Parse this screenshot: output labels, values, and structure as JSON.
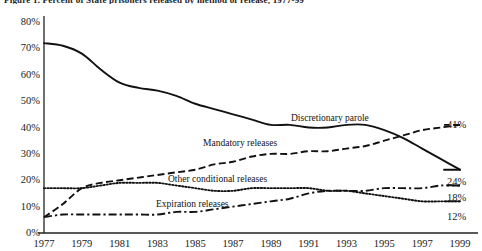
{
  "title": "Figure 1. Percent of State prisoners released by method of release, 1977-99",
  "axes": {
    "y_ticks": [
      "0%",
      "10%",
      "20%",
      "30%",
      "40%",
      "50%",
      "60%",
      "70%",
      "80%"
    ],
    "x_ticks": [
      "1977",
      "1979",
      "1981",
      "1983",
      "1985",
      "1987",
      "1989",
      "1991",
      "1993",
      "1995",
      "1997",
      "1999"
    ],
    "ylim": [
      0,
      80
    ],
    "xlim": [
      1977,
      1999
    ]
  },
  "end_labels": {
    "discretionary_parole": "41%",
    "mandatory_releases": "24%",
    "other_conditional_releases": "18%",
    "expiration_releases": "12%"
  },
  "series_labels": {
    "discretionary_parole": "Discretionary parole",
    "mandatory_releases": "Mandatory releases",
    "other_conditional_releases": "Other conditional releases",
    "expiration_releases": "Expiration releases"
  },
  "chart_data": {
    "type": "line",
    "title": "Figure 1. Percent of State prisoners released by method of release, 1977-99",
    "xlabel": "",
    "ylabel": "",
    "xlim": [
      1977,
      1999
    ],
    "ylim": [
      0,
      80
    ],
    "grid": false,
    "legend": "inline-annotations",
    "x": [
      1977,
      1978,
      1979,
      1980,
      1981,
      1982,
      1983,
      1984,
      1985,
      1986,
      1987,
      1988,
      1989,
      1990,
      1991,
      1992,
      1993,
      1994,
      1995,
      1996,
      1997,
      1998,
      1999
    ],
    "series": [
      {
        "name": "Discretionary parole",
        "style": "solid",
        "end_value": 41,
        "values": [
          72,
          71,
          68,
          62,
          57,
          55,
          54,
          52,
          49,
          47,
          45,
          43,
          41,
          41,
          40,
          40,
          41,
          41,
          39,
          36,
          32,
          28,
          24
        ]
      },
      {
        "name": "Mandatory releases",
        "style": "dashed",
        "end_value": 24,
        "values": [
          6,
          11,
          17,
          19,
          20,
          21,
          22,
          23,
          24,
          26,
          27,
          29,
          30,
          30,
          31,
          31,
          32,
          33,
          35,
          37,
          39,
          40,
          41
        ]
      },
      {
        "name": "Other conditional releases",
        "style": "dotted",
        "end_value": 12,
        "values": [
          17,
          17,
          17,
          18,
          19,
          19,
          19,
          18,
          17,
          16,
          16,
          17,
          17,
          17,
          17,
          16,
          16,
          15,
          14,
          13,
          12,
          12,
          12
        ]
      },
      {
        "name": "Expiration releases",
        "style": "dashdot",
        "end_value": 18,
        "values": [
          6,
          7,
          7,
          7,
          7,
          7,
          7,
          8,
          8,
          9,
          10,
          11,
          12,
          13,
          15,
          16,
          16,
          16,
          17,
          17,
          17,
          18,
          18
        ]
      }
    ]
  }
}
